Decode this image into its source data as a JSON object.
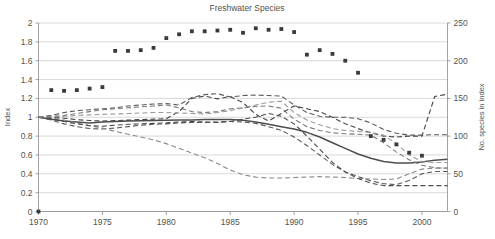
{
  "chart_data": {
    "type": "line",
    "title": "Freshwater Species",
    "xlabel": "",
    "ylabel": "Index",
    "y2label": "No. species in index",
    "xlim": [
      1970,
      2002
    ],
    "ylim": [
      0,
      2
    ],
    "y2lim": [
      0,
      250
    ],
    "grid": true,
    "legend": "none",
    "x_ticks": [
      "1970",
      "1975",
      "1980",
      "1985",
      "1990",
      "1995",
      "2000"
    ],
    "x_tick_values": [
      1970,
      1975,
      1980,
      1985,
      1990,
      1995,
      2000
    ],
    "y_ticks": [
      "0",
      "0.2",
      "0.4",
      "0.6",
      "0.8",
      "1",
      "1.2",
      "1.4",
      "1.6",
      "1.8",
      "2"
    ],
    "y_tick_values": [
      0,
      0.2,
      0.4,
      0.6,
      0.8,
      1,
      1.2,
      1.4,
      1.6,
      1.8,
      2
    ],
    "y2_ticks": [
      "0",
      "50",
      "100",
      "150",
      "200",
      "250"
    ],
    "y2_tick_values": [
      0,
      50,
      100,
      150,
      200,
      250
    ],
    "x": [
      1970,
      1971,
      1972,
      1973,
      1974,
      1975,
      1976,
      1977,
      1978,
      1979,
      1980,
      1981,
      1982,
      1983,
      1984,
      1985,
      1986,
      1987,
      1988,
      1989,
      1990,
      1991,
      1992,
      1993,
      1994,
      1995,
      1996,
      1997,
      1998,
      1999,
      2000,
      2001,
      2002
    ],
    "series": [
      {
        "name": "Freshwater index (all species)",
        "style": "solid",
        "color": "#4d4d4d",
        "axis": "left",
        "values": [
          1.0,
          0.98,
          0.96,
          0.95,
          0.94,
          0.95,
          0.955,
          0.96,
          0.962,
          0.965,
          0.967,
          0.97,
          0.972,
          0.975,
          0.976,
          0.975,
          0.968,
          0.95,
          0.925,
          0.9,
          0.875,
          0.84,
          0.79,
          0.73,
          0.67,
          0.61,
          0.565,
          0.53,
          0.515,
          0.515,
          0.525,
          0.545,
          0.555
        ]
      },
      {
        "name": "Upper confidence limit",
        "style": "dashed",
        "color": "#595959",
        "axis": "left",
        "values": [
          1.0,
          1.02,
          1.05,
          1.07,
          1.08,
          1.09,
          1.1,
          1.12,
          1.13,
          1.14,
          1.145,
          1.13,
          1.21,
          1.24,
          1.25,
          1.215,
          1.23,
          1.235,
          1.23,
          1.225,
          1.13,
          1.05,
          1.01,
          1.0,
          1.0,
          0.985,
          0.94,
          0.87,
          0.83,
          0.81,
          0.81,
          0.815,
          0.815
        ]
      },
      {
        "name": "Lower confidence limit",
        "style": "dashed",
        "color": "#595959",
        "axis": "left",
        "values": [
          1.0,
          0.97,
          0.93,
          0.9,
          0.88,
          0.875,
          0.885,
          0.9,
          0.915,
          0.925,
          0.93,
          0.94,
          0.945,
          0.945,
          0.95,
          0.955,
          0.95,
          0.935,
          0.9,
          0.86,
          0.79,
          0.7,
          0.6,
          0.5,
          0.42,
          0.37,
          0.325,
          0.295,
          0.285,
          0.33,
          0.4,
          0.425,
          0.425
        ]
      },
      {
        "name": "Temperate freshwater trend",
        "style": "dashed",
        "color": "#7a7a7a",
        "axis": "left",
        "values": [
          1.0,
          1.01,
          1.02,
          1.04,
          1.06,
          1.08,
          1.09,
          1.1,
          1.11,
          1.12,
          1.13,
          1.1,
          1.06,
          1.05,
          1.06,
          1.09,
          1.1,
          1.115,
          1.12,
          1.095,
          0.98,
          0.9,
          0.86,
          0.835,
          0.825,
          0.82,
          0.81,
          0.73,
          0.63,
          0.55,
          0.49,
          0.465,
          0.46
        ]
      },
      {
        "name": "Tropical freshwater trend",
        "style": "dashed",
        "color": "#8a8a8a",
        "axis": "left",
        "values": [
          1.0,
          0.99,
          0.97,
          0.94,
          0.91,
          0.885,
          0.85,
          0.82,
          0.79,
          0.76,
          0.72,
          0.67,
          0.62,
          0.57,
          0.51,
          0.44,
          0.39,
          0.365,
          0.355,
          0.355,
          0.36,
          0.365,
          0.37,
          0.365,
          0.36,
          0.35,
          0.345,
          0.34,
          0.345,
          0.4,
          0.45,
          0.46,
          0.46
        ]
      },
      {
        "name": "Regional trend A",
        "style": "dashed",
        "color": "#444444",
        "axis": "left",
        "values": [
          1.0,
          1.0,
          0.99,
          0.975,
          0.965,
          0.96,
          0.965,
          0.97,
          0.975,
          0.98,
          0.985,
          1.06,
          1.2,
          1.225,
          1.195,
          1.22,
          1.155,
          1.03,
          0.96,
          1.04,
          1.12,
          1.09,
          1.06,
          1.0,
          0.93,
          0.88,
          0.835,
          0.8,
          0.79,
          0.8,
          0.8,
          1.22,
          1.245
        ]
      },
      {
        "name": "Regional trend B",
        "style": "dashed",
        "color": "#4a4a4a",
        "axis": "left",
        "values": [
          1.0,
          0.985,
          0.955,
          0.93,
          0.91,
          0.905,
          0.915,
          0.925,
          0.93,
          0.935,
          0.94,
          0.95,
          0.955,
          0.95,
          0.945,
          0.955,
          0.98,
          1.0,
          1.04,
          1.01,
          0.93,
          0.8,
          0.66,
          0.52,
          0.42,
          0.35,
          0.3,
          0.275,
          0.275,
          0.275,
          0.275,
          0.275,
          0.275
        ]
      },
      {
        "name": "Regional trend C",
        "style": "dashed",
        "color": "#9a9a9a",
        "axis": "left",
        "values": [
          1.0,
          1.005,
          1.01,
          1.02,
          1.025,
          1.03,
          1.035,
          1.04,
          1.045,
          1.05,
          1.05,
          1.045,
          1.04,
          1.035,
          1.05,
          1.07,
          1.1,
          1.13,
          1.16,
          1.17,
          1.05,
          0.97,
          0.92,
          0.88,
          0.86,
          0.85,
          0.84,
          0.81,
          0.72,
          0.6,
          0.53,
          0.52,
          0.52
        ]
      }
    ],
    "marker_series": {
      "name": "No. species in index",
      "style": "square-markers",
      "color": "#3a3a3a",
      "axis": "right",
      "points": [
        {
          "x": 1970,
          "y": 0
        },
        {
          "x": 1971,
          "y": 161
        },
        {
          "x": 1972,
          "y": 160
        },
        {
          "x": 1973,
          "y": 161
        },
        {
          "x": 1974,
          "y": 163
        },
        {
          "x": 1975,
          "y": 165
        },
        {
          "x": 1976,
          "y": 213
        },
        {
          "x": 1977,
          "y": 213
        },
        {
          "x": 1978,
          "y": 214
        },
        {
          "x": 1979,
          "y": 217
        },
        {
          "x": 1980,
          "y": 230
        },
        {
          "x": 1981,
          "y": 235
        },
        {
          "x": 1982,
          "y": 239
        },
        {
          "x": 1983,
          "y": 239
        },
        {
          "x": 1984,
          "y": 240
        },
        {
          "x": 1985,
          "y": 241
        },
        {
          "x": 1986,
          "y": 237
        },
        {
          "x": 1987,
          "y": 243
        },
        {
          "x": 1988,
          "y": 241
        },
        {
          "x": 1989,
          "y": 242
        },
        {
          "x": 1990,
          "y": 238
        },
        {
          "x": 1991,
          "y": 208
        },
        {
          "x": 1992,
          "y": 214
        },
        {
          "x": 1993,
          "y": 209
        },
        {
          "x": 1994,
          "y": 200
        },
        {
          "x": 1995,
          "y": 184
        },
        {
          "x": 1996,
          "y": 100
        },
        {
          "x": 1997,
          "y": 95
        },
        {
          "x": 1998,
          "y": 89
        },
        {
          "x": 1999,
          "y": 78
        },
        {
          "x": 2000,
          "y": 74
        }
      ]
    }
  }
}
